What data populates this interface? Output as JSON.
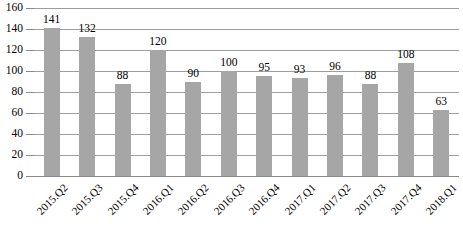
{
  "chart_data": {
    "type": "bar",
    "title": "",
    "xlabel": "",
    "ylabel": "",
    "ylim": [
      0,
      160
    ],
    "ytick_step": 20,
    "yticks": [
      0,
      20,
      40,
      60,
      80,
      100,
      120,
      140,
      160
    ],
    "grid": true,
    "legend": false,
    "bar_color": "#a6a6a6",
    "gridline_color": "#9e9e9e",
    "data_labels": true,
    "categories": [
      "2015.Q2",
      "2015.Q3",
      "2015.Q4",
      "2016.Q1",
      "2016.Q2",
      "2016.Q3",
      "2016.Q4",
      "2017.Q1",
      "2017.Q2",
      "2017.Q3",
      "2017.Q4",
      "2018.Q1"
    ],
    "values": [
      141,
      132,
      88,
      120,
      90,
      100,
      95,
      93,
      96,
      88,
      108,
      63
    ]
  }
}
